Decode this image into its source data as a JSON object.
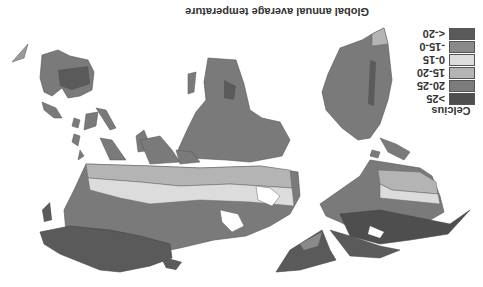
{
  "map": {
    "title": "Global annual average temperature",
    "orientation": "rotated 180 degrees (upside-down)",
    "legend": {
      "unit_label": "Celcius",
      "items": [
        {
          "label": "<-20",
          "color": "#5a5a5a"
        },
        {
          "label": "-15-0",
          "color": "#8a8a8a"
        },
        {
          "label": "0-15",
          "color": "#dcdcdc"
        },
        {
          "label": "15-20",
          "color": "#b4b4b4"
        },
        {
          "label": "20-25",
          "color": "#7c7c7c"
        },
        {
          "label": ">25",
          "color": "#4e4e4e"
        }
      ]
    }
  }
}
